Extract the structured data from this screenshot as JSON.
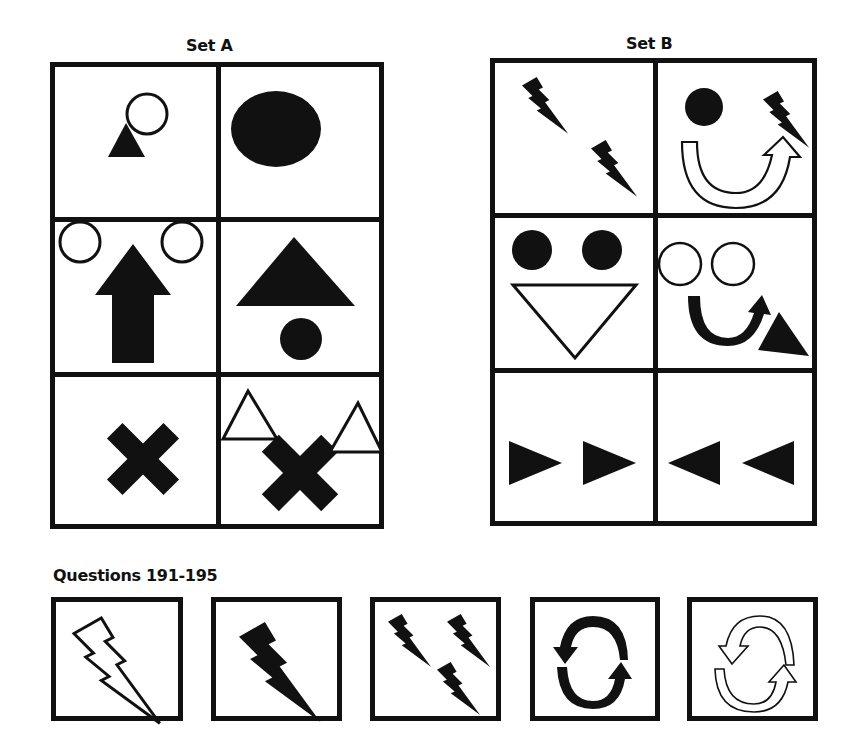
{
  "set_a": {
    "title": "Set A",
    "cells": [
      {
        "row": 0,
        "col": 0,
        "shapes": [
          "small-filled-triangle",
          "outline-circle"
        ]
      },
      {
        "row": 0,
        "col": 1,
        "shapes": [
          "large-filled-circle"
        ]
      },
      {
        "row": 1,
        "col": 0,
        "shapes": [
          "outline-circle",
          "filled-up-arrow",
          "outline-circle"
        ]
      },
      {
        "row": 1,
        "col": 1,
        "shapes": [
          "large-filled-triangle",
          "filled-circle"
        ]
      },
      {
        "row": 2,
        "col": 0,
        "shapes": [
          "filled-x-cross"
        ]
      },
      {
        "row": 2,
        "col": 1,
        "shapes": [
          "outline-triangle",
          "filled-x-cross",
          "outline-triangle"
        ]
      }
    ]
  },
  "set_b": {
    "title": "Set B",
    "cells": [
      {
        "row": 0,
        "col": 0,
        "shapes": [
          "filled-lightning-bolt",
          "filled-lightning-bolt"
        ]
      },
      {
        "row": 0,
        "col": 1,
        "shapes": [
          "filled-circle",
          "filled-lightning-bolt",
          "outline-u-turn-arrow"
        ]
      },
      {
        "row": 1,
        "col": 0,
        "shapes": [
          "filled-circle",
          "filled-circle",
          "outline-down-triangle"
        ]
      },
      {
        "row": 1,
        "col": 1,
        "shapes": [
          "outline-circle",
          "outline-circle",
          "filled-u-turn-arrow",
          "filled-triangle"
        ]
      },
      {
        "row": 2,
        "col": 0,
        "shapes": [
          "filled-right-triangle",
          "filled-right-triangle"
        ]
      },
      {
        "row": 2,
        "col": 1,
        "shapes": [
          "filled-left-triangle",
          "filled-left-triangle"
        ]
      }
    ]
  },
  "questions": {
    "title": "Questions 191-195",
    "items": [
      {
        "number": 191,
        "shapes": [
          "outline-lightning-bolt"
        ]
      },
      {
        "number": 192,
        "shapes": [
          "filled-lightning-bolt"
        ]
      },
      {
        "number": 193,
        "shapes": [
          "filled-lightning-bolt",
          "filled-lightning-bolt",
          "filled-lightning-bolt"
        ]
      },
      {
        "number": 194,
        "shapes": [
          "filled-cycle-arrows"
        ]
      },
      {
        "number": 195,
        "shapes": [
          "outline-cycle-arrows"
        ]
      }
    ]
  },
  "colors": {
    "ink": "#111111",
    "paper": "#ffffff"
  }
}
